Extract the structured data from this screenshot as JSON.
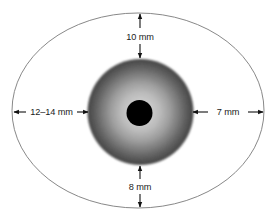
{
  "diagram": {
    "background_color": "#ffffff",
    "eyeball": {
      "name": "eyeball-outline",
      "shape": "ellipse",
      "center_x": 138,
      "center_y": 110.5,
      "radius_x": 126,
      "radius_y": 97.5,
      "stroke_color": "#7a7a7a",
      "fill_color": "#ffffff"
    },
    "iris": {
      "name": "iris",
      "shape": "circle",
      "center_x": 140.5,
      "center_y": 112,
      "radius": 53,
      "inner_color": "#e8e8e8",
      "mid_color": "#c9c9c9",
      "outer_color": "#8e8e8e"
    },
    "pupil": {
      "name": "pupil",
      "shape": "circle",
      "center_x": 139.5,
      "center_y": 113,
      "radius": 13,
      "color": "#000000"
    },
    "dimensions": [
      {
        "id": "top",
        "label": "10 mm",
        "orientation": "vertical",
        "measures": "sclera-to-iris-top-distance",
        "x": 140,
        "y_start": 14,
        "y_end": 58,
        "label_x": 140,
        "label_y": 36
      },
      {
        "id": "left",
        "label": "12–14 mm",
        "orientation": "horizontal",
        "measures": "sclera-to-iris-left-distance",
        "y": 112,
        "x_start": 14,
        "x_end": 88,
        "label_x": 51,
        "label_y": 112
      },
      {
        "id": "right",
        "label": "7 mm",
        "orientation": "horizontal",
        "measures": "iris-to-sclera-right-distance",
        "y": 112,
        "x_start": 193,
        "x_end": 263,
        "label_x": 228,
        "label_y": 112
      },
      {
        "id": "bottom",
        "label": "8 mm",
        "orientation": "vertical",
        "measures": "iris-to-sclera-bottom-distance",
        "x": 140,
        "y_start": 166,
        "y_end": 207,
        "label_x": 140,
        "label_y": 187
      }
    ],
    "line_color": "#111111"
  }
}
